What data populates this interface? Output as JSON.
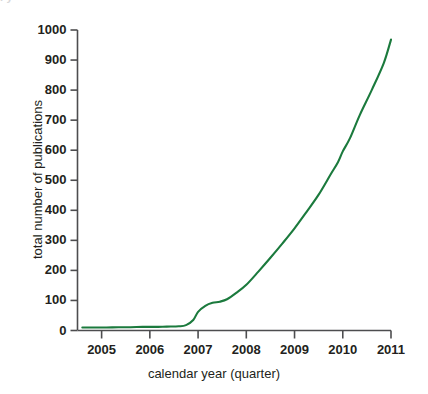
{
  "figure": {
    "top_crop_remnant": "           l                  y"
  },
  "chart_data": {
    "type": "line",
    "title": "",
    "subtitle": "",
    "xlabel": "calendar year (quarter)",
    "ylabel": "total number of publications",
    "xlim": [
      2004.5,
      2011.0
    ],
    "ylim": [
      0,
      1000
    ],
    "grid": false,
    "legend": null,
    "legend_position": "none",
    "line_color": "#1b7a3d",
    "axis_color": "#4d4d4f",
    "x_tick_labels": [
      "2005",
      "2006",
      "2007",
      "2008",
      "2009",
      "2010",
      "2011"
    ],
    "x_tick_values": [
      2005,
      2006,
      2007,
      2008,
      2009,
      2010,
      2011
    ],
    "y_tick_labels": [
      "0",
      "100",
      "200",
      "300",
      "400",
      "500",
      "600",
      "700",
      "800",
      "900",
      "1000"
    ],
    "y_tick_values": [
      0,
      100,
      200,
      300,
      400,
      500,
      600,
      700,
      800,
      900,
      1000
    ],
    "series": [
      {
        "name": "total number of publications",
        "color": "#1b7a3d",
        "x": [
          2004.6,
          2004.85,
          2005.1,
          2005.35,
          2005.6,
          2005.85,
          2006.1,
          2006.35,
          2006.6,
          2006.75,
          2006.9,
          2007.0,
          2007.15,
          2007.3,
          2007.45,
          2007.6,
          2007.8,
          2008.0,
          2008.25,
          2008.5,
          2008.75,
          2009.0,
          2009.25,
          2009.5,
          2009.75,
          2009.9,
          2010.0,
          2010.15,
          2010.35,
          2010.6,
          2010.85,
          2011.0
        ],
        "y": [
          10,
          10,
          10,
          11,
          11,
          12,
          12,
          13,
          14,
          18,
          35,
          62,
          82,
          92,
          96,
          104,
          126,
          152,
          196,
          242,
          290,
          340,
          395,
          452,
          520,
          560,
          596,
          640,
          716,
          800,
          890,
          968
        ]
      }
    ],
    "annotations": []
  }
}
